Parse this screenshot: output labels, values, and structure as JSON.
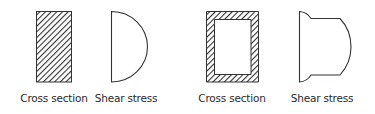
{
  "diagram": {
    "type": "shear-stress-distribution",
    "colors": {
      "stroke": "#333333",
      "hatch": "#333333",
      "background": "#ffffff"
    },
    "panels": [
      {
        "id": "solid-rectangle",
        "cross_section_label": "Cross section",
        "shear_stress_label": "Shear stress",
        "cross_section_shape": "solid hatched rectangle",
        "shear_profile": "parabolic (half-ellipse)"
      },
      {
        "id": "hollow-rectangle",
        "cross_section_label": "Cross section",
        "shear_stress_label": "Shear stress",
        "cross_section_shape": "hollow hatched rectangular tube",
        "shear_profile": "stepped parabolic with flange jumps"
      }
    ]
  }
}
